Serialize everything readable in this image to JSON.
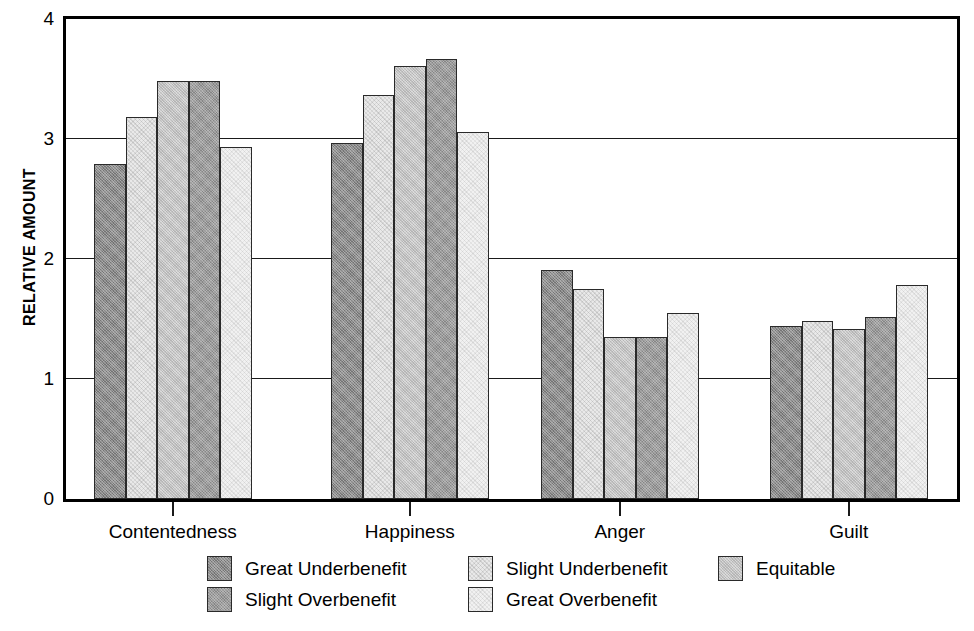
{
  "chart_data": {
    "type": "bar",
    "title": "",
    "xlabel": "",
    "ylabel": "RELATIVE AMOUNT",
    "ylim": [
      0,
      4
    ],
    "yticks": [
      0,
      1,
      2,
      3,
      4
    ],
    "ytick_labels": [
      "0",
      "1",
      "2",
      "3",
      "4"
    ],
    "grid": "horizontal",
    "legend_position": "bottom",
    "categories": [
      "Contentedness",
      "Happiness",
      "Anger",
      "Guilt"
    ],
    "series": [
      {
        "name": "Great Underbenefit",
        "color": "#8a8a8a",
        "fill": "f1",
        "values": [
          2.79,
          2.97,
          1.91,
          1.44
        ]
      },
      {
        "name": "Slight Underbenefit",
        "color": "#e9e9e9",
        "fill": "f2",
        "values": [
          3.18,
          3.37,
          1.75,
          1.48
        ]
      },
      {
        "name": "Equitable",
        "color": "#cfcfcf",
        "fill": "f3",
        "values": [
          3.48,
          3.61,
          1.35,
          1.42
        ]
      },
      {
        "name": "Slight Overbenefit",
        "color": "#9c9c9c",
        "fill": "f4",
        "values": [
          3.48,
          3.67,
          1.35,
          1.52
        ]
      },
      {
        "name": "Great Overbenefit",
        "color": "#f1f1f1",
        "fill": "f5",
        "values": [
          2.93,
          3.06,
          1.55,
          1.78
        ]
      }
    ]
  },
  "legend": {
    "items": [
      {
        "label": "Great Underbenefit",
        "fill": "f1"
      },
      {
        "label": "Slight Overbenefit",
        "fill": "f4"
      },
      {
        "label": "Slight Underbenefit",
        "fill": "f2"
      },
      {
        "label": "Great Overbenefit",
        "fill": "f5"
      },
      {
        "label": "Equitable",
        "fill": "f3"
      }
    ],
    "columns": [
      {
        "x": 207,
        "rows": [
          0,
          1
        ]
      },
      {
        "x": 468,
        "rows": [
          2,
          3
        ]
      },
      {
        "x": 718,
        "rows": [
          4
        ]
      }
    ]
  }
}
